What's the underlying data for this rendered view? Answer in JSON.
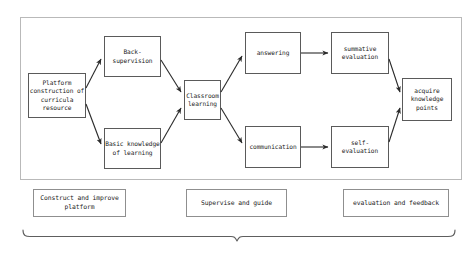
{
  "diagram": {
    "colors": {
      "node_border": "#5a5a5a",
      "frame_border": "#b9b9b9",
      "caption_border": "#8f8f8f",
      "arrow": "#2b2b2b",
      "brace": "#5e5e5e",
      "background": "#ffffff",
      "text": "#1c1c1c"
    },
    "nodes": [
      {
        "id": "platform",
        "label": "Platform\nconstruction of\ncurricula\nresource",
        "x": 28,
        "y": 73,
        "w": 58,
        "h": 45
      },
      {
        "id": "back-supervision",
        "label": "Back-supervision",
        "x": 104,
        "y": 36,
        "w": 57,
        "h": 41
      },
      {
        "id": "basic-knowledge",
        "label": "Basic knowledge\nof learning",
        "x": 104,
        "y": 128,
        "w": 57,
        "h": 41
      },
      {
        "id": "classroom",
        "label": "Classroom\nlearning",
        "x": 184,
        "y": 80,
        "w": 37,
        "h": 40
      },
      {
        "id": "answering",
        "label": "answering",
        "x": 245,
        "y": 32,
        "w": 56,
        "h": 42
      },
      {
        "id": "communication",
        "label": "communication",
        "x": 245,
        "y": 126,
        "w": 56,
        "h": 42
      },
      {
        "id": "summative-evaluation",
        "label": "summative\nevaluation",
        "x": 331,
        "y": 32,
        "w": 58,
        "h": 42
      },
      {
        "id": "self-evaluation",
        "label": "self-\nevaluation",
        "x": 331,
        "y": 126,
        "w": 58,
        "h": 42
      },
      {
        "id": "acquire-knowledge",
        "label": "acquire\nknowledge\npoints",
        "x": 402,
        "y": 78,
        "w": 50,
        "h": 43
      }
    ],
    "edges": [
      {
        "id": "platform-to-back-supervision",
        "from": "platform",
        "to": "back-supervision"
      },
      {
        "id": "platform-to-basic-knowledge",
        "from": "platform",
        "to": "basic-knowledge"
      },
      {
        "id": "back-supervision-to-classroom",
        "from": "back-supervision",
        "to": "classroom"
      },
      {
        "id": "basic-knowledge-to-classroom",
        "from": "basic-knowledge",
        "to": "classroom"
      },
      {
        "id": "classroom-to-answering",
        "from": "classroom",
        "to": "answering"
      },
      {
        "id": "classroom-to-communication",
        "from": "classroom",
        "to": "communication"
      },
      {
        "id": "answering-to-summative",
        "from": "answering",
        "to": "summative-evaluation"
      },
      {
        "id": "communication-to-self",
        "from": "communication",
        "to": "self-evaluation"
      },
      {
        "id": "summative-to-acquire",
        "from": "summative-evaluation",
        "to": "acquire-knowledge"
      },
      {
        "id": "self-to-acquire",
        "from": "self-evaluation",
        "to": "acquire-knowledge"
      }
    ],
    "captions": [
      {
        "id": "construct-and-improve-platform",
        "label": "Construct and improve\nplatform",
        "x": 33,
        "y": 189,
        "w": 93,
        "h": 28
      },
      {
        "id": "supervise-and-guide",
        "label": "Supervise and guide",
        "x": 186,
        "y": 189,
        "w": 101,
        "h": 28
      },
      {
        "id": "evaluation-and-feedback",
        "label": "evaluation and feedback",
        "x": 343,
        "y": 189,
        "w": 106,
        "h": 28
      }
    ],
    "frame": {
      "x": 20,
      "y": 17,
      "w": 442,
      "h": 163
    },
    "brace": {
      "x_start": 23,
      "x_end": 455,
      "y": 236,
      "tip_x": 237,
      "tip_depth": 5,
      "arm_height": 6
    }
  }
}
